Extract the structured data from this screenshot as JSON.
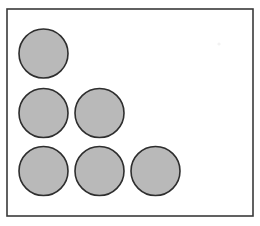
{
  "figure": {
    "title": "Array of shaded circles in a staircase arrangement",
    "background_color": "#ffffff",
    "canvas": {
      "width": 260,
      "height": 226
    },
    "frame": {
      "name": "bounding-box",
      "x": 7,
      "y": 9,
      "width": 246,
      "height": 207,
      "stroke_color": "#3a3a3a",
      "stroke_width": 1.6,
      "fill": "none"
    },
    "shape_style": {
      "fill_color": "#b9b9b9",
      "stroke_color": "#2e2e2e",
      "stroke_width": 1.6,
      "shape": "circle",
      "radius": 24.5,
      "diameter": 49
    },
    "counts": {
      "total_shapes": 6,
      "row_counts": [
        1,
        2,
        3
      ],
      "column_counts": [
        3,
        2,
        1
      ],
      "rows": 3,
      "columns": 3
    },
    "grid": {
      "column_centers_x": [
        43.5,
        99.5,
        155.5
      ],
      "row_centers_y": [
        53.5,
        113,
        171
      ],
      "column_pitch": 56,
      "row_pitch": 58
    },
    "shapes": [
      {
        "id": "circle-r1-c1",
        "row": 1,
        "column": 1,
        "cx": 43.5,
        "cy": 53.5,
        "r": 24.5
      },
      {
        "id": "circle-r2-c1",
        "row": 2,
        "column": 1,
        "cx": 43.5,
        "cy": 113.0,
        "r": 24.5
      },
      {
        "id": "circle-r2-c2",
        "row": 2,
        "column": 2,
        "cx": 99.5,
        "cy": 113.0,
        "r": 24.5
      },
      {
        "id": "circle-r3-c1",
        "row": 3,
        "column": 1,
        "cx": 43.5,
        "cy": 171.0,
        "r": 24.5
      },
      {
        "id": "circle-r3-c2",
        "row": 3,
        "column": 2,
        "cx": 99.5,
        "cy": 171.0,
        "r": 24.5
      },
      {
        "id": "circle-r3-c3",
        "row": 3,
        "column": 3,
        "cx": 155.5,
        "cy": 171.0,
        "r": 24.5
      }
    ],
    "artifacts": [
      {
        "id": "speck-top-right",
        "cx": 219,
        "cy": 44,
        "r": 1.6
      }
    ]
  }
}
